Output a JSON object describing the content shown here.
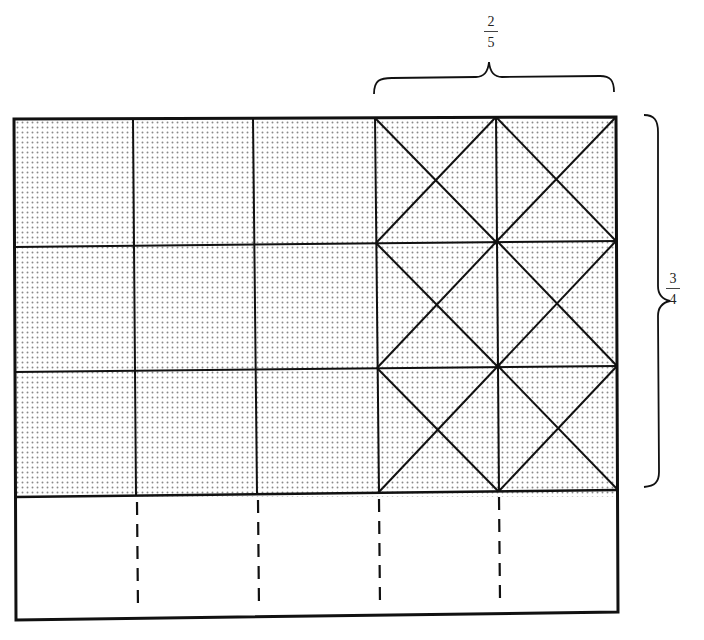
{
  "diagram": {
    "labels": {
      "top_fraction": {
        "numerator": "2",
        "denominator": "5"
      },
      "right_fraction": {
        "numerator": "3",
        "denominator": "4"
      }
    },
    "grid": {
      "columns": 5,
      "rows": 4,
      "shaded_rows": 3,
      "crossed_columns": 2,
      "shaded_fraction": "3/4",
      "crossed_fraction": "2/5",
      "bottom_row_divider_style": "dashed"
    },
    "colors": {
      "line": "#111111",
      "shade_dot": "#8a8a8a",
      "background": "#ffffff"
    }
  }
}
